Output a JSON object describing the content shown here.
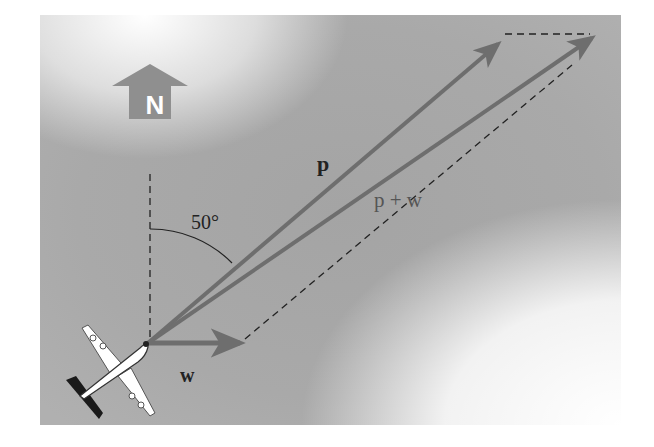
{
  "diagram": {
    "type": "vector-addition",
    "compass": {
      "label": "N",
      "icon": "north-arrow-icon"
    },
    "angle": {
      "label": "50°",
      "value_degrees": 50,
      "measured_from": "north"
    },
    "vectors": [
      {
        "name": "p",
        "label": "p",
        "from": [
          148,
          343
        ],
        "to": [
          500,
          42
        ]
      },
      {
        "name": "w",
        "label": "w",
        "from": [
          148,
          343
        ],
        "to": [
          243,
          343
        ]
      },
      {
        "name": "p+w",
        "label": "p + w",
        "from": [
          148,
          343
        ],
        "to": [
          595,
          36
        ]
      }
    ],
    "colors": {
      "background_gray": "#a9a9a9",
      "vector": "#6e6e6e",
      "dashed_line": "#222222",
      "compass_fill": "#8f8f8f",
      "plane_body": "#ffffff",
      "plane_shadow": "#1a1a1a"
    }
  }
}
